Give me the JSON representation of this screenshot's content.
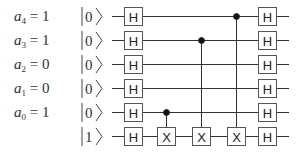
{
  "diagram": {
    "type": "quantum-circuit",
    "title": "",
    "rows": [
      {
        "var": "a",
        "sub": "4",
        "value": "1",
        "ket": "0"
      },
      {
        "var": "a",
        "sub": "3",
        "value": "1",
        "ket": "0"
      },
      {
        "var": "a",
        "sub": "2",
        "value": "0",
        "ket": "0"
      },
      {
        "var": "a",
        "sub": "1",
        "value": "0",
        "ket": "0"
      },
      {
        "var": "a",
        "sub": "0",
        "value": "1",
        "ket": "0"
      },
      {
        "var": "",
        "sub": "",
        "value": "",
        "ket": "1"
      }
    ],
    "gates": {
      "hadamard_label": "H",
      "not_label": "X"
    },
    "cnots": [
      {
        "control_row": 4,
        "target_row": 5
      },
      {
        "control_row": 1,
        "target_row": 5
      },
      {
        "control_row": 0,
        "target_row": 5
      }
    ],
    "colors": {
      "line": "#333333",
      "box": "#555555"
    }
  }
}
